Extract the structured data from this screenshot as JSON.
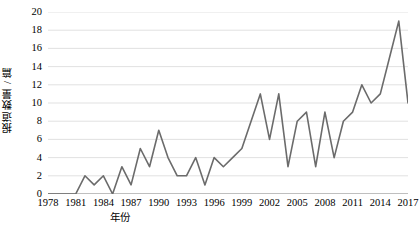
{
  "chart_data": {
    "type": "line",
    "title": "",
    "subtitle": "",
    "xlabel": "年份",
    "ylabel": "报道数量 / 篇",
    "xlim": [
      1978,
      2017
    ],
    "ylim": [
      0,
      20
    ],
    "grid": true,
    "legend": null,
    "legend_position": "none",
    "line_color": "#6b6b6b",
    "line_width": 1.6,
    "x_tick_labels": [
      "1978",
      "1981",
      "1984",
      "1987",
      "1990",
      "1993",
      "1996",
      "1999",
      "2002",
      "2005",
      "2008",
      "2011",
      "2014",
      "2017"
    ],
    "x_tick_values": [
      1978,
      1981,
      1984,
      1987,
      1990,
      1993,
      1996,
      1999,
      2002,
      2005,
      2008,
      2011,
      2014,
      2017
    ],
    "y_tick_labels": [
      "0",
      "2",
      "4",
      "6",
      "8",
      "10",
      "12",
      "14",
      "16",
      "18",
      "20"
    ],
    "y_tick_values": [
      0,
      2,
      4,
      6,
      8,
      10,
      12,
      14,
      16,
      18,
      20
    ],
    "x": [
      1978,
      1979,
      1980,
      1981,
      1982,
      1983,
      1984,
      1985,
      1986,
      1987,
      1988,
      1989,
      1990,
      1991,
      1992,
      1993,
      1994,
      1995,
      1996,
      1997,
      1998,
      1999,
      2000,
      2001,
      2002,
      2003,
      2004,
      2005,
      2006,
      2007,
      2008,
      2009,
      2010,
      2011,
      2012,
      2013,
      2014,
      2015,
      2016,
      2017
    ],
    "values": [
      0,
      0,
      0,
      0,
      2,
      1,
      2,
      0,
      3,
      1,
      5,
      3,
      7,
      4,
      2,
      2,
      4,
      1,
      4,
      3,
      4,
      5,
      8,
      11,
      6,
      11,
      3,
      8,
      9,
      3,
      9,
      4,
      8,
      9,
      12,
      10,
      11,
      15,
      19,
      10
    ],
    "series": [
      {
        "name": "报道数量",
        "values": [
          0,
          0,
          0,
          0,
          2,
          1,
          2,
          0,
          3,
          1,
          5,
          3,
          7,
          4,
          2,
          2,
          4,
          1,
          4,
          3,
          4,
          5,
          8,
          11,
          6,
          11,
          3,
          8,
          9,
          3,
          9,
          4,
          8,
          9,
          12,
          10,
          11,
          15,
          19,
          10
        ]
      }
    ]
  },
  "axes": {
    "y_title": "报道数量 / 篇",
    "x_title": "年份"
  },
  "colors": {
    "line": "#6b6b6b",
    "grid": "#d9d9d9",
    "axis": "#808080",
    "text": "#000000",
    "background": "#ffffff"
  }
}
